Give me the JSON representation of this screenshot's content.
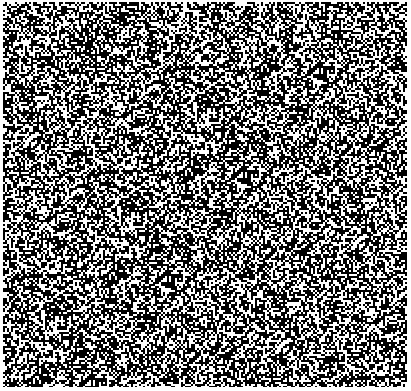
{
  "image": {
    "description": "Binary black-and-white random noise texture (random-dot pattern)",
    "width": 411,
    "height": 391,
    "cell_size": 2,
    "foreground": "#000000",
    "background": "#ffffff",
    "black_density": 0.55,
    "margin": {
      "left": 3,
      "top": 2,
      "right": 4,
      "bottom": 4
    }
  }
}
